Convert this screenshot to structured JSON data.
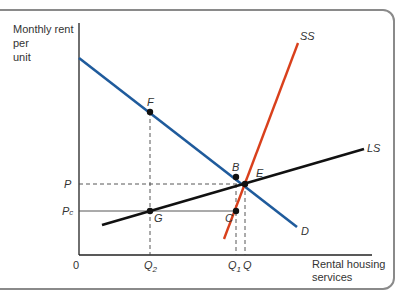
{
  "diagram": {
    "y_axis_label": [
      "Monthly rent",
      "per",
      "unit"
    ],
    "x_axis_label": [
      "Rental housing",
      "services"
    ],
    "origin_label": "0",
    "price_labels": {
      "P": "P",
      "Pc_main": "P",
      "Pc_sub": "c"
    },
    "quantity_labels": {
      "Q2_main": "Q",
      "Q2_sub": "2",
      "Q1_main": "Q",
      "Q1_sub": "1",
      "Q": "Q"
    },
    "curves": [
      {
        "name": "D",
        "label": "D",
        "color": "#1f5b9c",
        "from": [
          79,
          58
        ],
        "to": [
          297,
          227
        ]
      },
      {
        "name": "SS",
        "label": "SS",
        "color": "#d9401c",
        "from": [
          298,
          43
        ],
        "to": [
          224,
          239
        ]
      },
      {
        "name": "LS",
        "label": "LS",
        "color": "#111111",
        "from": [
          102,
          225
        ],
        "to": [
          364,
          149
        ]
      }
    ],
    "points": [
      {
        "label": "F",
        "x": 150,
        "y": 112
      },
      {
        "label": "B",
        "x": 236,
        "y": 177
      },
      {
        "label": "E",
        "x": 245,
        "y": 184
      },
      {
        "label": "C",
        "x": 236,
        "y": 211
      },
      {
        "label": "G",
        "x": 150,
        "y": 211
      }
    ],
    "colors": {
      "demand": "#1f5b9c",
      "short_run_supply": "#d9401c",
      "long_run_supply": "#111111",
      "frame": "#8a8a8a"
    }
  }
}
